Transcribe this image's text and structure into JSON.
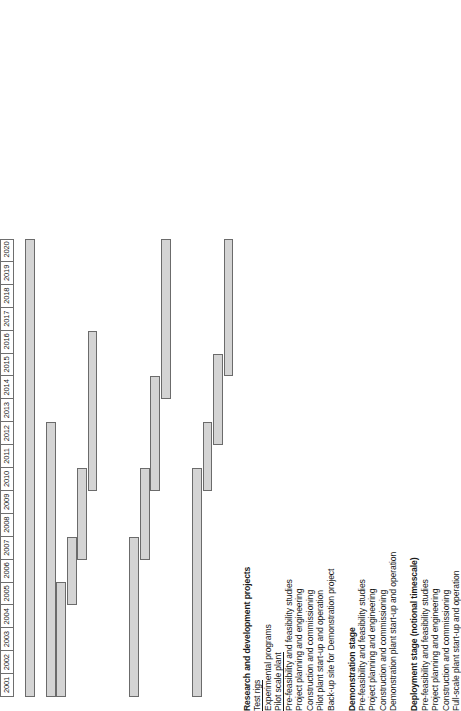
{
  "chart_data": {
    "type": "bar",
    "chart_kind": "gantt",
    "title": "",
    "xlabel": "",
    "ylabel": "",
    "orientation": "rotated-90-ccw",
    "axis": {
      "years": [
        2001,
        2002,
        2003,
        2004,
        2005,
        2006,
        2007,
        2008,
        2009,
        2010,
        2011,
        2012,
        2013,
        2014,
        2015,
        2016,
        2017,
        2018,
        2019,
        2020
      ],
      "year_labels": [
        "2001",
        "2002",
        "2003",
        "2004",
        "2005",
        "2006",
        "2007",
        "2008",
        "2009",
        "2010",
        "2011",
        "2012",
        "2013",
        "2014",
        "2015",
        "2016",
        "2017",
        "2018",
        "2019",
        "2020"
      ],
      "range": [
        2001,
        2021
      ],
      "grid": false,
      "position": "top"
    },
    "bar_color": "#d4d4d4",
    "bar_border_color": "#6b6b6b",
    "groups": [
      {
        "heading": "Research and development projects",
        "tasks": [
          {
            "label": "Test rigs",
            "underline": true,
            "start": 2001,
            "end": 2021
          },
          {
            "label": "Experimental programs",
            "underline": false,
            "start": null,
            "end": null
          },
          {
            "label": "Pilot scale plant",
            "underline": true,
            "start": 2001,
            "end": 2013
          },
          {
            "label": "Pre-feasibility and feasibility studies",
            "underline": false,
            "start": 2001,
            "end": 2006
          },
          {
            "label": "Project planning and engineering",
            "underline": false,
            "start": 2005,
            "end": 2008
          },
          {
            "label": "Construction and commissioning",
            "underline": false,
            "start": 2007,
            "end": 2011
          },
          {
            "label": "Pilot plant start-up and operation",
            "underline": false,
            "start": 2010,
            "end": 2017
          },
          {
            "label": "Back-up site for Demonstration project",
            "underline": false,
            "start": null,
            "end": null
          }
        ]
      },
      {
        "heading": "Demonstration stage",
        "tasks": [
          {
            "label": "Pre-feasibility and feasibility studies",
            "underline": false,
            "start": 2001,
            "end": 2008
          },
          {
            "label": "Project planning and engineering",
            "underline": false,
            "start": 2007,
            "end": 2011
          },
          {
            "label": "Construction and commissioning",
            "underline": false,
            "start": 2010,
            "end": 2015
          },
          {
            "label": "Demonstration plant start-up and operation",
            "underline": false,
            "start": 2014,
            "end": 2021
          }
        ]
      },
      {
        "heading": "Deployment stage (notional timescale)",
        "tasks": [
          {
            "label": "Pre-feasibility and feasibility studies",
            "underline": false,
            "start": 2001,
            "end": 2011
          },
          {
            "label": "Project planning and engineering",
            "underline": false,
            "start": 2010,
            "end": 2013
          },
          {
            "label": "Construction and commissioning",
            "underline": false,
            "start": 2012,
            "end": 2016
          },
          {
            "label": "Full-scale plant start-up and operation",
            "underline": false,
            "start": 2015,
            "end": 2021
          }
        ]
      }
    ]
  }
}
